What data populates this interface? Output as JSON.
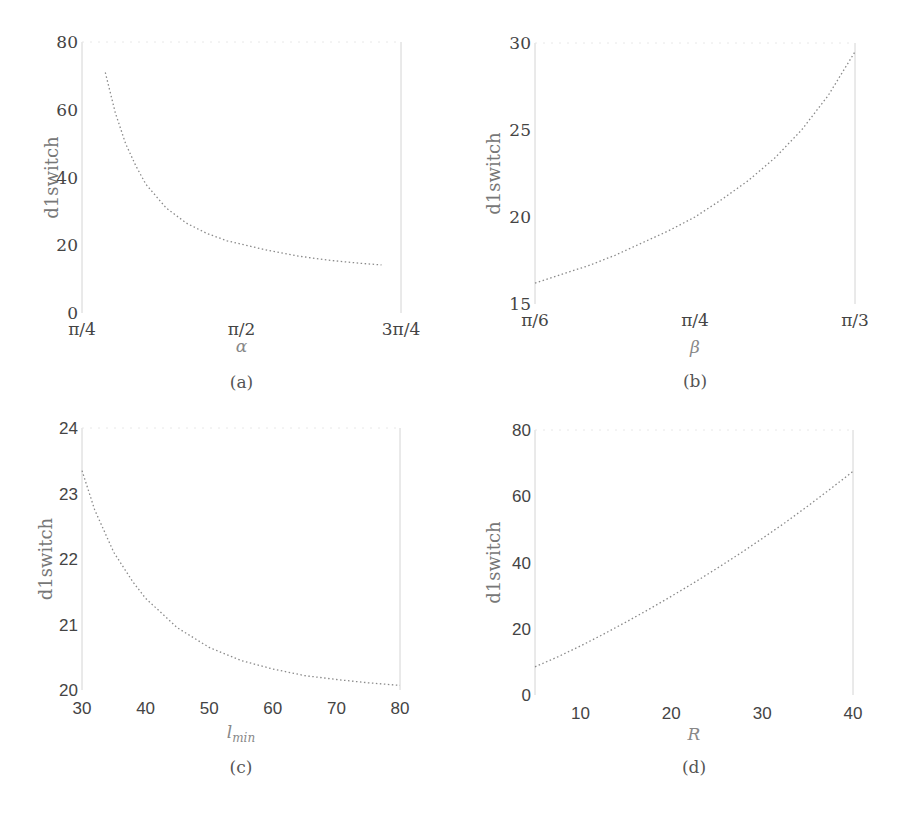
{
  "chart_data": [
    {
      "id": "a",
      "type": "line",
      "caption": "(a)",
      "xlabel": "α",
      "ylabel": "d1switch",
      "xticks": [
        "π/4",
        "π/2",
        "3π/4"
      ],
      "xtick_values": [
        0.7854,
        1.5708,
        2.3562
      ],
      "yticks": [
        "0",
        "20",
        "40",
        "60",
        "80"
      ],
      "ylim": [
        0,
        80
      ],
      "xlim": [
        0.7854,
        2.3562
      ],
      "tick_font": "serif",
      "x": [
        0.9,
        0.95,
        1.0,
        1.05,
        1.1,
        1.2,
        1.3,
        1.4,
        1.5,
        1.5708,
        1.7,
        1.85,
        2.0,
        2.15,
        2.26
      ],
      "y": [
        71,
        59,
        50,
        43.5,
        38,
        31,
        26.5,
        23.5,
        21.3,
        20.3,
        18.5,
        16.8,
        15.6,
        14.7,
        14.2
      ]
    },
    {
      "id": "b",
      "type": "line",
      "caption": "(b)",
      "xlabel": "β",
      "ylabel": "d1switch",
      "xticks": [
        "π/6",
        "π/4",
        "π/3"
      ],
      "xtick_values": [
        0.5236,
        0.7854,
        1.0472
      ],
      "yticks": [
        "15",
        "20",
        "25",
        "30"
      ],
      "ylim": [
        15,
        30
      ],
      "xlim": [
        0.5236,
        1.0472
      ],
      "tick_font": "serif",
      "x": [
        0.5236,
        0.5672,
        0.6109,
        0.6545,
        0.6981,
        0.7418,
        0.7854,
        0.829,
        0.8727,
        0.9163,
        0.9599,
        1.0036,
        1.0472
      ],
      "y": [
        16.2,
        16.7,
        17.2,
        17.8,
        18.5,
        19.2,
        20.0,
        21.0,
        22.1,
        23.4,
        25.0,
        27.0,
        29.5
      ]
    },
    {
      "id": "c",
      "type": "line",
      "caption": "(c)",
      "xlabel": "l_min",
      "xlabel_main": "l",
      "xlabel_sub": "min",
      "ylabel": "d1switch",
      "xticks": [
        "30",
        "40",
        "50",
        "60",
        "70",
        "80"
      ],
      "xtick_values": [
        30,
        40,
        50,
        60,
        70,
        80
      ],
      "yticks": [
        "20",
        "21",
        "22",
        "23",
        "24"
      ],
      "ylim": [
        20,
        24
      ],
      "xlim": [
        30,
        80
      ],
      "tick_font": "sans",
      "x": [
        30,
        32,
        35,
        38,
        40,
        45,
        50,
        55,
        60,
        65,
        70,
        75,
        80
      ],
      "y": [
        23.35,
        22.75,
        22.1,
        21.65,
        21.4,
        20.95,
        20.65,
        20.45,
        20.32,
        20.22,
        20.16,
        20.11,
        20.07
      ]
    },
    {
      "id": "d",
      "type": "line",
      "caption": "(d)",
      "xlabel": "R",
      "ylabel": "d1switch",
      "xticks": [
        "10",
        "20",
        "30",
        "40"
      ],
      "xtick_values": [
        10,
        20,
        30,
        40
      ],
      "yticks": [
        "0",
        "20",
        "40",
        "60",
        "80"
      ],
      "ylim": [
        0,
        80
      ],
      "xlim": [
        5,
        40
      ],
      "tick_font": "sans",
      "x": [
        5,
        7.5,
        10,
        12.5,
        15,
        17.5,
        20,
        22.5,
        25,
        27.5,
        30,
        32.5,
        35,
        37.5,
        40
      ],
      "y": [
        8.5,
        11.5,
        14.8,
        18.3,
        22,
        25.8,
        29.8,
        33.9,
        38.2,
        42.6,
        47.2,
        52,
        57,
        62.2,
        67.5
      ]
    }
  ]
}
